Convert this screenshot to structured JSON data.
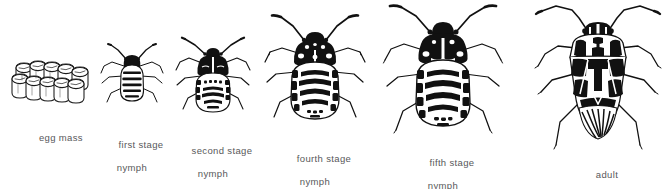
{
  "figure": {
    "background_color": "#ffffff",
    "ink_color": "#000000",
    "label_color": "#58585a",
    "arrangement": "left-to-right, increasing size"
  },
  "stages": [
    {
      "id": "egg-mass",
      "label_line1": "egg mass",
      "label_line2": "",
      "icon": "egg-mass-illustration",
      "art_style": "outline",
      "fill": "white-with-black-outline",
      "egg_count": 12,
      "center_x": 52,
      "label_center_x": 52,
      "label_top": 120
    },
    {
      "id": "first-stage-nymph",
      "label_line1": "first stage",
      "label_line2": "nymph",
      "icon": "nymph-instar-1-illustration",
      "art_style": "solid-black-head-banded-abdomen",
      "body_length_px": 36,
      "center_x": 132,
      "label_center_x": 132,
      "label_top": 127
    },
    {
      "id": "second-stage-nymph",
      "label_line1": "second stage",
      "label_line2": "nymph",
      "icon": "nymph-instar-2-illustration",
      "art_style": "solid-black-thorax-spotted-abdomen",
      "body_length_px": 48,
      "center_x": 213,
      "label_center_x": 213,
      "label_top": 133
    },
    {
      "id": "fourth-stage-nymph",
      "label_line1": "fourth stage",
      "label_line2": "nymph",
      "icon": "nymph-instar-4-illustration",
      "art_style": "bold-chevron-banded-abdomen",
      "body_length_px": 72,
      "center_x": 315,
      "label_center_x": 315,
      "label_top": 145
    },
    {
      "id": "fifth-stage-nymph",
      "label_line1": "fifth stage",
      "label_line2": "nymph",
      "icon": "nymph-instar-5-illustration",
      "art_style": "bold-chevron-banded-abdomen-wingpads",
      "body_length_px": 86,
      "center_x": 443,
      "label_center_x": 443,
      "label_top": 150
    },
    {
      "id": "adult",
      "label_line1": "adult",
      "label_line2": "",
      "icon": "adult-bug-illustration",
      "art_style": "shield-shape-with-scutellum-and-wings",
      "body_length_px": 100,
      "center_x": 598,
      "label_center_x": 598,
      "label_top": 163
    }
  ]
}
